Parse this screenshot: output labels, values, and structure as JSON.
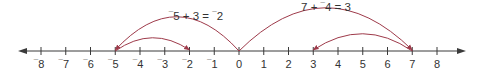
{
  "diagram": {
    "type": "number-line",
    "colors": {
      "axis": "#3a3a3a",
      "arc": "#9e3a4a",
      "text": "#333333",
      "background": "#ffffff"
    },
    "axis": {
      "min": -8,
      "max": 8,
      "y": 51,
      "x_start": 18,
      "x_end": 466,
      "origin_x": 239,
      "unit_px": 24.75
    },
    "ticks": [
      {
        "value": -8,
        "label": "8",
        "negative": true
      },
      {
        "value": -7,
        "label": "7",
        "negative": true
      },
      {
        "value": -6,
        "label": "6",
        "negative": true
      },
      {
        "value": -5,
        "label": "5",
        "negative": true
      },
      {
        "value": -4,
        "label": "4",
        "negative": true
      },
      {
        "value": -3,
        "label": "3",
        "negative": true
      },
      {
        "value": -2,
        "label": "2",
        "negative": true
      },
      {
        "value": -1,
        "label": "1",
        "negative": true
      },
      {
        "value": 0,
        "label": "0",
        "negative": false
      },
      {
        "value": 1,
        "label": "1",
        "negative": false
      },
      {
        "value": 2,
        "label": "2",
        "negative": false
      },
      {
        "value": 3,
        "label": "3",
        "negative": false
      },
      {
        "value": 4,
        "label": "4",
        "negative": false
      },
      {
        "value": 5,
        "label": "5",
        "negative": false
      },
      {
        "value": 6,
        "label": "6",
        "negative": false
      },
      {
        "value": 7,
        "label": "7",
        "negative": false
      },
      {
        "value": 8,
        "label": "8",
        "negative": false
      }
    ],
    "equations": [
      {
        "id": "left",
        "text": "⁻5 + 3 = ⁻2",
        "label_x": 196,
        "label_y": 20,
        "arcs": [
          {
            "from": 0,
            "to": -5,
            "height": 34
          },
          {
            "from": -5,
            "to": -2,
            "height": 13
          }
        ]
      },
      {
        "id": "right",
        "text": "7 + ⁻4 = 3",
        "label_x": 326,
        "label_y": 11,
        "arcs": [
          {
            "from": 0,
            "to": 7,
            "height": 43
          },
          {
            "from": 7,
            "to": 3,
            "height": 17
          }
        ]
      }
    ]
  }
}
